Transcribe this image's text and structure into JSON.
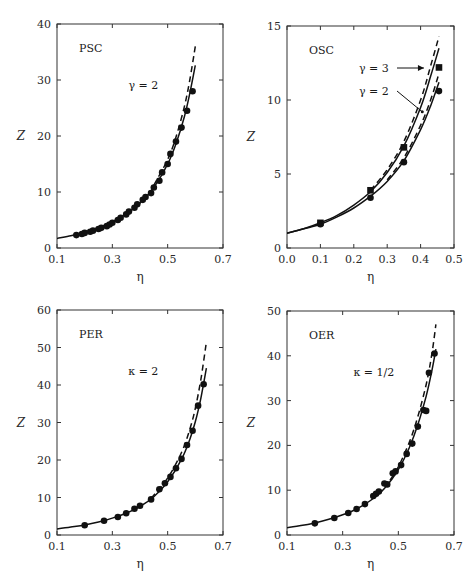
{
  "chart_data": [
    {
      "id": "psc",
      "type": "scatter",
      "title": "PSC",
      "annotation": "γ = 2",
      "xlabel": "η",
      "ylabel": "Z",
      "xlim": [
        0.1,
        0.7
      ],
      "ylim": [
        0,
        40
      ],
      "xticks": [
        0.1,
        0.3,
        0.5,
        0.7
      ],
      "yticks": [
        0,
        10,
        20,
        30,
        40
      ],
      "grid": false,
      "box": {
        "left": 57,
        "right": 223,
        "top": 24,
        "bottom": 248
      },
      "series": [
        {
          "name": "simulation",
          "style": "circle",
          "x": [
            0.17,
            0.19,
            0.2,
            0.22,
            0.23,
            0.25,
            0.26,
            0.28,
            0.29,
            0.3,
            0.32,
            0.33,
            0.35,
            0.36,
            0.38,
            0.39,
            0.41,
            0.42,
            0.44,
            0.45,
            0.47,
            0.48,
            0.5,
            0.51,
            0.53,
            0.55,
            0.57,
            0.59
          ],
          "y": [
            2.3,
            2.5,
            2.7,
            2.9,
            3.1,
            3.4,
            3.6,
            3.9,
            4.2,
            4.5,
            5.0,
            5.4,
            6.0,
            6.5,
            7.2,
            7.8,
            8.6,
            9.1,
            9.8,
            10.8,
            12.0,
            13.5,
            15.0,
            16.8,
            19.0,
            21.5,
            24.5,
            28.0
          ]
        },
        {
          "name": "theory-solid",
          "style": "solid",
          "x": [
            0.1,
            0.15,
            0.2,
            0.25,
            0.3,
            0.35,
            0.4,
            0.45,
            0.5,
            0.53,
            0.56,
            0.58,
            0.6
          ],
          "y": [
            1.7,
            2.2,
            2.8,
            3.6,
            4.7,
            6.1,
            8.0,
            10.8,
            15.0,
            18.6,
            23.4,
            27.6,
            32.6
          ]
        },
        {
          "name": "theory-dashed",
          "style": "dashed",
          "x": [
            0.45,
            0.5,
            0.53,
            0.56,
            0.58,
            0.6
          ],
          "y": [
            11.2,
            15.8,
            19.8,
            25.2,
            30.0,
            36.0
          ]
        }
      ]
    },
    {
      "id": "osc",
      "type": "scatter",
      "title": "OSC",
      "annotations": [
        "γ = 3",
        "γ = 2"
      ],
      "xlabel": "η",
      "ylabel": "Z",
      "xlim": [
        0.0,
        0.5
      ],
      "ylim": [
        0,
        15
      ],
      "xticks": [
        0.0,
        0.1,
        0.2,
        0.3,
        0.4,
        0.5
      ],
      "yticks": [
        0,
        5,
        10,
        15
      ],
      "grid": false,
      "box": {
        "left": 287,
        "right": 454,
        "top": 26,
        "bottom": 248
      },
      "series": [
        {
          "name": "γ=3 simulation",
          "style": "square",
          "x": [
            0.1,
            0.25,
            0.35,
            0.455
          ],
          "y": [
            1.7,
            3.9,
            6.8,
            12.2
          ]
        },
        {
          "name": "γ=2 simulation",
          "style": "circle",
          "x": [
            0.1,
            0.25,
            0.35,
            0.455
          ],
          "y": [
            1.6,
            3.4,
            5.8,
            10.6
          ]
        },
        {
          "name": "γ=3 theory-solid",
          "style": "solid",
          "x": [
            0.0,
            0.05,
            0.1,
            0.15,
            0.2,
            0.25,
            0.3,
            0.35,
            0.4,
            0.43,
            0.455
          ],
          "y": [
            1.0,
            1.3,
            1.7,
            2.2,
            2.9,
            3.8,
            5.1,
            6.9,
            9.5,
            11.6,
            13.5
          ]
        },
        {
          "name": "γ=3 theory-dashed",
          "style": "dashed",
          "x": [
            0.25,
            0.3,
            0.35,
            0.4,
            0.43,
            0.455
          ],
          "y": [
            3.9,
            5.3,
            7.2,
            10.0,
            12.3,
            14.3
          ]
        },
        {
          "name": "γ=2 theory-solid",
          "style": "solid",
          "x": [
            0.0,
            0.05,
            0.1,
            0.15,
            0.2,
            0.25,
            0.3,
            0.35,
            0.4,
            0.43,
            0.455
          ],
          "y": [
            1.0,
            1.3,
            1.6,
            2.1,
            2.7,
            3.5,
            4.5,
            5.9,
            8.0,
            9.6,
            11.2
          ]
        },
        {
          "name": "γ=2 theory-dashed",
          "style": "dashed",
          "x": [
            0.3,
            0.35,
            0.4,
            0.43,
            0.455
          ],
          "y": [
            4.6,
            6.1,
            8.3,
            10.0,
            11.8
          ]
        }
      ]
    },
    {
      "id": "per",
      "type": "scatter",
      "title": "PER",
      "annotation": "κ = 2",
      "xlabel": "η",
      "ylabel": "Z",
      "xlim": [
        0.1,
        0.7
      ],
      "ylim": [
        0,
        60
      ],
      "xticks": [
        0.1,
        0.3,
        0.5,
        0.7
      ],
      "yticks": [
        0,
        10,
        20,
        30,
        40,
        50,
        60
      ],
      "grid": false,
      "box": {
        "left": 57,
        "right": 223,
        "top": 310,
        "bottom": 535
      },
      "series": [
        {
          "name": "simulation",
          "style": "circle",
          "x": [
            0.2,
            0.27,
            0.32,
            0.35,
            0.38,
            0.4,
            0.44,
            0.47,
            0.49,
            0.51,
            0.53,
            0.55,
            0.57,
            0.59,
            0.61,
            0.63
          ],
          "y": [
            2.6,
            3.8,
            4.8,
            5.8,
            7.0,
            7.8,
            9.5,
            12.2,
            13.8,
            15.5,
            17.8,
            20.3,
            24.0,
            27.8,
            34.5,
            40.2
          ]
        },
        {
          "name": "theory-solid",
          "style": "solid",
          "x": [
            0.1,
            0.15,
            0.2,
            0.25,
            0.3,
            0.35,
            0.4,
            0.45,
            0.5,
            0.55,
            0.58,
            0.6,
            0.62,
            0.64
          ],
          "y": [
            1.6,
            2.1,
            2.7,
            3.5,
            4.5,
            5.8,
            7.6,
            10.2,
            14.2,
            20.2,
            25.5,
            30.2,
            36.5,
            44.5
          ]
        },
        {
          "name": "theory-dashed",
          "style": "dashed",
          "x": [
            0.44,
            0.5,
            0.55,
            0.58,
            0.6,
            0.62,
            0.64
          ],
          "y": [
            9.8,
            15.2,
            22.0,
            28.2,
            33.8,
            41.5,
            51.5
          ]
        }
      ]
    },
    {
      "id": "oer",
      "type": "scatter",
      "title": "OER",
      "annotation": "κ = 1/2",
      "xlabel": "η",
      "ylabel": "Z",
      "xlim": [
        0.1,
        0.7
      ],
      "ylim": [
        0,
        50
      ],
      "xticks": [
        0.1,
        0.3,
        0.5,
        0.7
      ],
      "yticks": [
        0,
        10,
        20,
        30,
        40,
        50
      ],
      "grid": false,
      "box": {
        "left": 287,
        "right": 454,
        "top": 311,
        "bottom": 535
      },
      "series": [
        {
          "name": "simulation",
          "style": "circle",
          "x": [
            0.2,
            0.27,
            0.32,
            0.35,
            0.38,
            0.41,
            0.42,
            0.43,
            0.45,
            0.46,
            0.48,
            0.49,
            0.51,
            0.53,
            0.55,
            0.57,
            0.59,
            0.6,
            0.61,
            0.63
          ],
          "y": [
            2.6,
            3.8,
            4.9,
            5.8,
            6.9,
            8.7,
            9.2,
            9.7,
            11.5,
            11.3,
            13.8,
            14.2,
            15.6,
            18.1,
            20.4,
            24.2,
            27.9,
            27.7,
            36.2,
            40.5
          ]
        },
        {
          "name": "theory-solid",
          "style": "solid",
          "x": [
            0.1,
            0.15,
            0.2,
            0.25,
            0.3,
            0.35,
            0.4,
            0.45,
            0.5,
            0.54,
            0.57,
            0.6,
            0.62,
            0.635
          ],
          "y": [
            1.6,
            2.1,
            2.7,
            3.5,
            4.5,
            5.8,
            7.7,
            10.4,
            14.6,
            19.6,
            24.6,
            31.0,
            36.5,
            41.5
          ]
        },
        {
          "name": "theory-dashed",
          "style": "dashed",
          "x": [
            0.47,
            0.5,
            0.54,
            0.57,
            0.6,
            0.62,
            0.635
          ],
          "y": [
            12.2,
            15.2,
            20.8,
            26.4,
            33.6,
            40.2,
            47.0
          ]
        }
      ]
    }
  ]
}
